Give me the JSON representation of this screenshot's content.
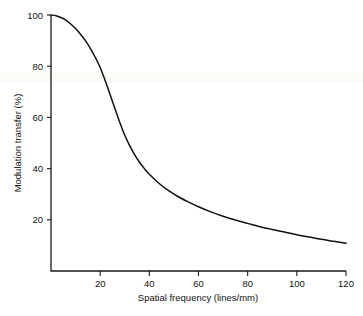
{
  "chart_data": {
    "type": "line",
    "title": "",
    "xlabel": "Spatial frequency (lines/mm)",
    "ylabel": "Modulation transfer (%)",
    "xlim": [
      0,
      120
    ],
    "ylim": [
      0,
      100
    ],
    "grid": false,
    "legend": null,
    "xticks": [
      20,
      40,
      60,
      80,
      100,
      120
    ],
    "yticks": [
      20,
      40,
      60,
      80,
      100
    ],
    "xtick_labels": [
      "20",
      "40",
      "60",
      "80",
      "100",
      "120"
    ],
    "ytick_labels": [
      "20",
      "40",
      "60",
      "80",
      "100"
    ],
    "series": [
      {
        "name": "Modulation transfer function",
        "color": "#111111",
        "x": [
          0,
          2,
          4,
          6,
          8,
          10,
          12,
          14,
          16,
          18,
          20,
          22,
          24,
          26,
          28,
          30,
          32,
          34,
          36,
          38,
          40,
          44,
          48,
          52,
          56,
          60,
          65,
          70,
          75,
          80,
          85,
          90,
          95,
          100,
          105,
          110,
          115,
          120
        ],
        "y": [
          100.0,
          99.7,
          99.0,
          98.0,
          96.5,
          94.7,
          92.5,
          90.0,
          87.0,
          83.5,
          79.5,
          74.5,
          69.0,
          63.5,
          58.0,
          53.0,
          49.0,
          45.5,
          42.5,
          40.0,
          37.8,
          34.2,
          31.3,
          28.9,
          26.9,
          25.1,
          23.1,
          21.4,
          19.9,
          18.6,
          17.3,
          16.2,
          15.2,
          14.2,
          13.3,
          12.4,
          11.6,
          10.8
        ]
      }
    ]
  },
  "labels": {
    "x_axis_title": "Spatial frequency (lines/mm)",
    "y_axis_title": "Modulation transfer (%)"
  }
}
